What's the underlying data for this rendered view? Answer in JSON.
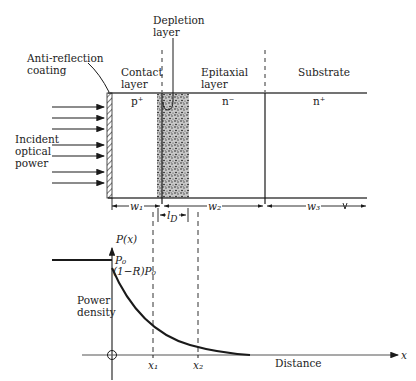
{
  "figure": {
    "labels": {
      "depletion_layer": [
        "Depletion",
        "layer"
      ],
      "anti_reflection": [
        "Anti-reflection",
        "coating"
      ],
      "contact_layer": [
        "Contact",
        "layer"
      ],
      "epitaxial_layer": [
        "Epitaxial",
        "layer"
      ],
      "substrate": "Substrate",
      "incident": [
        "Incident",
        "optical",
        "power"
      ],
      "doping_contact": "p⁺",
      "doping_epitaxial": "n⁻",
      "doping_substrate": "n⁺"
    },
    "dimensions": {
      "w1": "w₁",
      "w2": "w₂",
      "w3": "w₃",
      "lD": "l",
      "lD_sub": "D"
    },
    "plot": {
      "y_axis_label": "P(x)",
      "x_axis_label": "x",
      "distance_label": "Distance",
      "power_density": [
        "Power",
        "density"
      ],
      "p0": "P₀",
      "transmitted": "(1−R)P₀",
      "origin": "0",
      "x1": "x₁",
      "x2": "x₂"
    },
    "colors": {
      "line": "#1a1a1a",
      "shading": "#555555",
      "background": "#ffffff"
    }
  }
}
